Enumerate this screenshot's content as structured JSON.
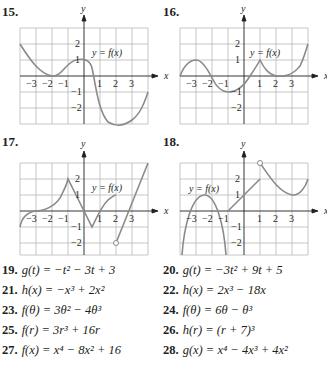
{
  "figures": [
    {
      "number": "15.",
      "label": "y = f(x)",
      "x_axis": "x",
      "y_axis": "y"
    },
    {
      "number": "16.",
      "label": "y = f(x)",
      "x_axis": "x",
      "y_axis": "y"
    },
    {
      "number": "17.",
      "label": "y = f(x)",
      "x_axis": "x",
      "y_axis": "y"
    },
    {
      "number": "18.",
      "label": "y = f(x)",
      "x_axis": "x",
      "y_axis": "y"
    }
  ],
  "ticks": {
    "x": [
      "−3",
      "−2",
      "−1",
      "1",
      "2",
      "3"
    ],
    "y": [
      "2",
      "1",
      "−1",
      "−2"
    ]
  },
  "colors": {
    "curve": "#8a8a8a",
    "grid": "#b8b8b8",
    "axis": "#231f20",
    "text": "#231f20"
  },
  "exercises": [
    {
      "num": "19.",
      "text": "g(t) = −t² − 3t + 3"
    },
    {
      "num": "20.",
      "text": "g(t) = −3t² + 9t + 5"
    },
    {
      "num": "21.",
      "text": "h(x) = −x³ + 2x²"
    },
    {
      "num": "22.",
      "text": "h(x) = 2x³ − 18x"
    },
    {
      "num": "23.",
      "text": "f(θ) = 3θ² − 4θ³"
    },
    {
      "num": "24.",
      "text": "f(θ) = 6θ − θ³"
    },
    {
      "num": "25.",
      "text": "f(r) = 3r³ + 16r"
    },
    {
      "num": "26.",
      "text": "h(r) = (r + 7)³"
    },
    {
      "num": "27.",
      "text": "f(x) = x⁴ − 8x² + 16"
    },
    {
      "num": "28.",
      "text": "g(x) = x⁴ − 4x³ + 4x²"
    }
  ]
}
